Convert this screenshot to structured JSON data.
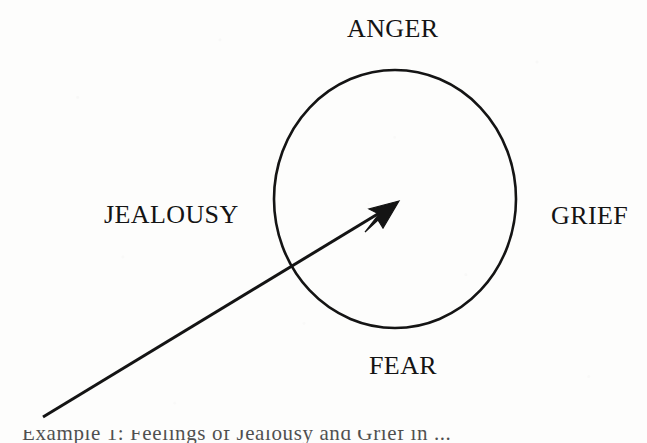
{
  "figure": {
    "kind": "emotion-compass-diagram",
    "background_color": "#fdfdfc",
    "ink_color": "#141414",
    "labels": {
      "top": "ANGER",
      "left": "JEALOUSY",
      "right": "GRIEF",
      "bottom": "FEAR"
    },
    "shapes": {
      "circle": {
        "name": "emotion-circle",
        "center_x": 395,
        "center_y": 199,
        "radius_x": 121,
        "radius_y": 129,
        "stroke_width": 2.6,
        "fill": "none"
      },
      "arrow": {
        "name": "direction-arrow",
        "tail_x": 43,
        "tail_y": 417,
        "tip_x": 397,
        "tip_y": 203,
        "stroke_width": 3.0,
        "head_length": 26,
        "head_width": 13
      }
    },
    "caption_partial": "Example 1: Feelings of Jealousy and Grief in ..."
  }
}
